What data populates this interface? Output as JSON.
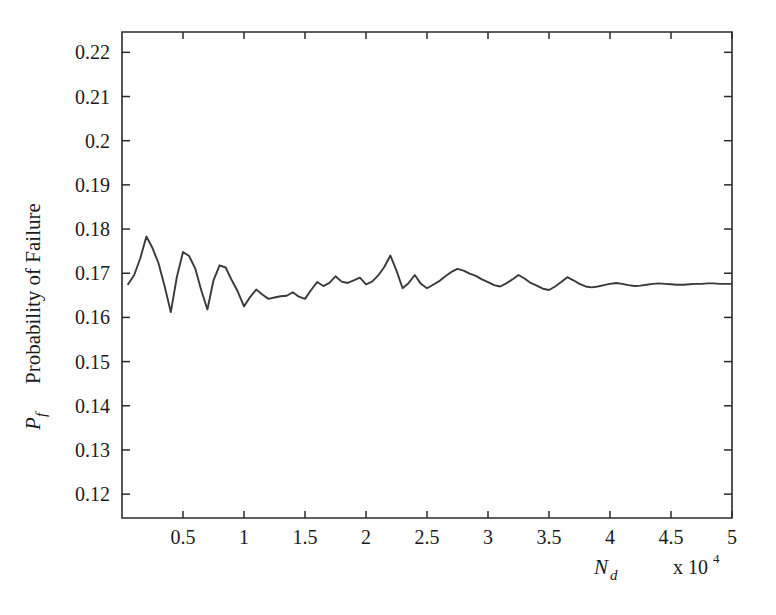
{
  "figure": {
    "background_color": "#ffffff",
    "line_color": "#3a3a3a",
    "axis_color": "#2b2b2b"
  },
  "axes": {
    "y_axis_title_symbol": "P",
    "y_axis_title_subscript": "f",
    "y_axis_title_text": "Probability of Failure",
    "x_axis_title_symbol": "N",
    "x_axis_title_subscript": "d",
    "x_axis_multiplier_base": "x 10",
    "x_axis_multiplier_exponent": "4"
  },
  "chart_data": {
    "type": "line",
    "title": "",
    "xlabel": "N_d",
    "ylabel": "P_f  Probability of Failure",
    "x_multiplier": "x 10^4",
    "xlim": [
      0,
      50000
    ],
    "ylim": [
      0.1146,
      0.2246
    ],
    "grid": false,
    "legend": null,
    "xticks": [
      5000,
      10000,
      15000,
      20000,
      25000,
      30000,
      35000,
      40000,
      45000,
      50000
    ],
    "xticklabels": [
      "0.5",
      "1",
      "1.5",
      "2",
      "2.5",
      "3",
      "3.5",
      "4",
      "4.5",
      "5"
    ],
    "yticks": [
      0.12,
      0.13,
      0.14,
      0.15,
      0.16,
      0.17,
      0.18,
      0.19,
      0.2,
      0.21,
      0.22
    ],
    "yticklabels": [
      "0.12",
      "0.13",
      "0.14",
      "0.15",
      "0.16",
      "0.17",
      "0.18",
      "0.19",
      "0.2",
      "0.21",
      "0.22"
    ],
    "series": [
      {
        "name": "Probability of Failure",
        "x": [
          500,
          1000,
          1500,
          2000,
          2500,
          3000,
          3500,
          4000,
          4500,
          5000,
          5500,
          6000,
          6500,
          7000,
          7500,
          8000,
          8500,
          9000,
          9500,
          10000,
          10500,
          11000,
          11500,
          12000,
          12500,
          13000,
          13500,
          14000,
          14500,
          15000,
          15500,
          16000,
          16500,
          17000,
          17500,
          18000,
          18500,
          19000,
          19500,
          20000,
          20500,
          21000,
          21500,
          22000,
          22500,
          23000,
          23500,
          24000,
          24500,
          25000,
          25500,
          26000,
          26500,
          27000,
          27500,
          28000,
          28500,
          29000,
          29500,
          30000,
          30500,
          31000,
          31500,
          32000,
          32500,
          33000,
          33500,
          34000,
          34500,
          35000,
          35500,
          36000,
          36500,
          37000,
          37500,
          38000,
          38500,
          39000,
          39500,
          40000,
          40500,
          41000,
          41500,
          42000,
          42500,
          43000,
          43500,
          44000,
          44500,
          45000,
          45500,
          46000,
          46500,
          47000,
          47500,
          48000,
          48500,
          49000,
          49500,
          50000
        ],
        "y": [
          0.1675,
          0.1696,
          0.1734,
          0.1783,
          0.1757,
          0.1722,
          0.167,
          0.1612,
          0.1692,
          0.1748,
          0.1739,
          0.1711,
          0.1661,
          0.1618,
          0.1684,
          0.1718,
          0.1713,
          0.1684,
          0.1658,
          0.1625,
          0.1646,
          0.1663,
          0.1652,
          0.1642,
          0.1645,
          0.1648,
          0.1649,
          0.1657,
          0.1647,
          0.1642,
          0.1662,
          0.168,
          0.1671,
          0.1678,
          0.1693,
          0.1681,
          0.1678,
          0.1684,
          0.169,
          0.1675,
          0.1681,
          0.1695,
          0.1714,
          0.174,
          0.1706,
          0.1666,
          0.1678,
          0.1696,
          0.1676,
          0.1666,
          0.1674,
          0.1682,
          0.1693,
          0.1703,
          0.171,
          0.1706,
          0.1699,
          0.1694,
          0.1686,
          0.168,
          0.1673,
          0.167,
          0.1677,
          0.1686,
          0.1696,
          0.1688,
          0.1678,
          0.1672,
          0.1665,
          0.1662,
          0.167,
          0.168,
          0.1691,
          0.1684,
          0.1676,
          0.167,
          0.1668,
          0.167,
          0.1673,
          0.1676,
          0.1678,
          0.1676,
          0.1673,
          0.1671,
          0.1672,
          0.1674,
          0.1676,
          0.1677,
          0.1676,
          0.1675,
          0.1674,
          0.1674,
          0.1675,
          0.1676,
          0.1676,
          0.1677,
          0.1677,
          0.1676,
          0.1676,
          0.1676
        ]
      }
    ]
  }
}
